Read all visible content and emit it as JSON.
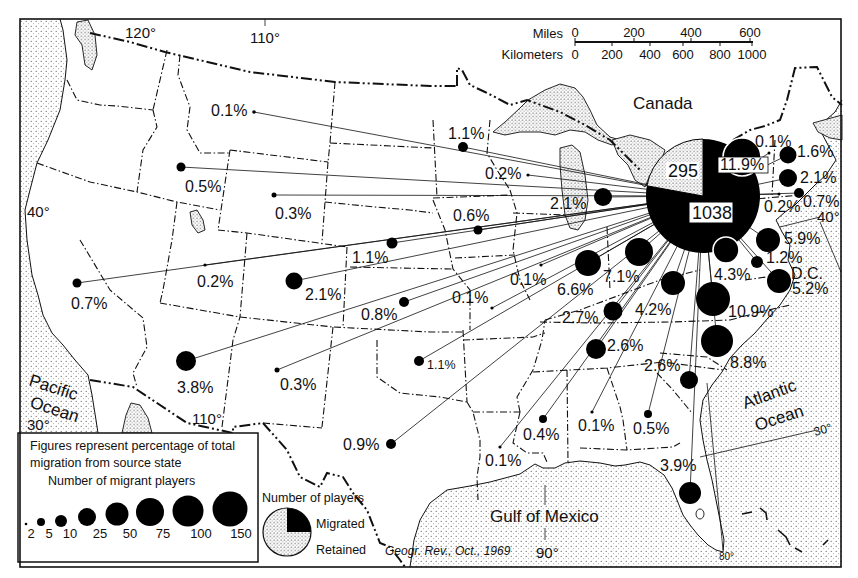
{
  "map": {
    "labels": {
      "canada": "Canada",
      "pacific_line1": "Pacific",
      "pacific_line2": "Ocean",
      "atlantic_line1": "Atlantic",
      "atlantic_line2": "Ocean",
      "gulf": "Gulf of Mexico",
      "dc": "D.C."
    },
    "graticule": {
      "lon_120": "120°",
      "lon_110_top": "110°",
      "lon_110_bottom": "110°",
      "lon_90": "90°",
      "lon_80": "80°",
      "lat_40_west": "40°",
      "lat_30_west": "30°",
      "lat_40_east": "40°",
      "lat_30_east": "30°"
    },
    "citation": "Geogr. Rev., Oct., 1969"
  },
  "scale_bar": {
    "miles_label": "Miles",
    "miles_ticks": [
      {
        "text": "0",
        "x": 575
      },
      {
        "text": "200",
        "x": 634
      },
      {
        "text": "400",
        "x": 691
      },
      {
        "text": "600",
        "x": 750
      }
    ],
    "km_label": "Kilometers",
    "km_ticks": [
      {
        "text": "0",
        "x": 575
      },
      {
        "text": "200",
        "x": 612
      },
      {
        "text": "400",
        "x": 650
      },
      {
        "text": "600",
        "x": 683
      },
      {
        "text": "800",
        "x": 720
      },
      {
        "text": "1000",
        "x": 752
      }
    ]
  },
  "pie": {
    "center": [
      703,
      196
    ],
    "radius": 57,
    "retained": 295,
    "migrated": 1038,
    "retained_label": "295",
    "migrated_label": "1038"
  },
  "flows": [
    {
      "pct": "0.1%",
      "dot": [
        254,
        112
      ],
      "r": 1.8,
      "label": [
        211,
        116
      ]
    },
    {
      "pct": "0.5%",
      "dot": [
        181,
        167
      ],
      "r": 4.5,
      "label": [
        185,
        192
      ]
    },
    {
      "pct": "0.3%",
      "dot": [
        274,
        195
      ],
      "r": 2.5,
      "label": [
        275,
        219
      ]
    },
    {
      "pct": "0.7%",
      "dot": [
        77,
        283
      ],
      "r": 4.5,
      "label": [
        71,
        309
      ]
    },
    {
      "pct": "0.2%",
      "dot": [
        205,
        265
      ],
      "r": 1.6,
      "label": [
        197,
        287
      ]
    },
    {
      "pct": "1.1%",
      "dot": [
        392,
        243
      ],
      "r": 5.5,
      "label": [
        352,
        263
      ]
    },
    {
      "pct": "2.1%",
      "dot": [
        294,
        281
      ],
      "r": 8.5,
      "label": [
        305,
        300
      ]
    },
    {
      "pct": "0.8%",
      "dot": [
        404,
        302
      ],
      "r": 5,
      "label": [
        361,
        320
      ]
    },
    {
      "pct": "0.1%",
      "dot": [
        492,
        308
      ],
      "r": 1.6,
      "label": [
        452,
        303
      ]
    },
    {
      "pct": "0.1%",
      "dot": [
        541,
        265
      ],
      "r": 1.6,
      "label": [
        510,
        285
      ]
    },
    {
      "pct": "0.6%",
      "dot": [
        478,
        230
      ],
      "r": 4.5,
      "label": [
        453,
        221
      ]
    },
    {
      "pct": "1.1%",
      "dot": [
        419,
        361
      ],
      "r": 5,
      "label": [
        427,
        369
      ],
      "small": true
    },
    {
      "pct": "0.3%",
      "dot": [
        277,
        370
      ],
      "r": 2.5,
      "label": [
        280,
        390
      ]
    },
    {
      "pct": "3.8%",
      "dot": [
        186,
        361
      ],
      "r": 10,
      "label": [
        177,
        393
      ]
    },
    {
      "pct": "0.9%",
      "dot": [
        391,
        444
      ],
      "r": 5,
      "label": [
        343,
        450
      ]
    },
    {
      "pct": "1.1%",
      "dot": [
        463,
        147
      ],
      "r": 5,
      "label": [
        448,
        139
      ]
    },
    {
      "pct": "0.2%",
      "dot": [
        528,
        175
      ],
      "r": 1.6,
      "label": [
        485,
        179
      ]
    },
    {
      "pct": "2.1%",
      "dot": [
        603,
        197
      ],
      "r": 9,
      "label": [
        550,
        209
      ]
    },
    {
      "pct": "0.1%",
      "dot": [
        769,
        153
      ],
      "r": 1.5,
      "label": [
        755,
        147
      ]
    },
    {
      "pct": "1.6%",
      "dot": [
        788,
        155
      ],
      "r": 8.5,
      "label": [
        797,
        157
      ]
    },
    {
      "pct": "2.1%",
      "dot": [
        788,
        178
      ],
      "r": 9,
      "label": [
        800,
        183
      ]
    },
    {
      "pct": "0.7%",
      "dot": [
        799,
        193
      ],
      "r": 5,
      "label": [
        803,
        207
      ]
    },
    {
      "pct": "0.2%",
      "dot": [
        779,
        194
      ],
      "r": 1.5,
      "label": [
        764,
        212
      ]
    },
    {
      "pct": "11.9%",
      "dot": [
        742,
        157
      ],
      "r": 19,
      "label": [
        720,
        170
      ],
      "outlined": true,
      "boxed": true
    },
    {
      "pct": "5.9%",
      "dot": [
        768,
        240
      ],
      "r": 12,
      "label": [
        784,
        244
      ]
    },
    {
      "pct": "4.3%",
      "dot": [
        726,
        250
      ],
      "r": 13,
      "label": [
        714,
        280
      ],
      "outlined": true
    },
    {
      "pct": "1.2%",
      "dot": [
        757,
        262
      ],
      "r": 6,
      "label": [
        766,
        263
      ]
    },
    {
      "pct": "5.2%",
      "dot": [
        779,
        281
      ],
      "r": 12,
      "label": [
        792,
        294
      ]
    },
    {
      "pct": "7.1%",
      "dot": [
        639,
        252
      ],
      "r": 14,
      "label": [
        603,
        282
      ]
    },
    {
      "pct": "6.6%",
      "dot": [
        588,
        263
      ],
      "r": 13,
      "label": [
        557,
        295
      ]
    },
    {
      "pct": "4.2%",
      "dot": [
        673,
        283
      ],
      "r": 12,
      "label": [
        635,
        315
      ]
    },
    {
      "pct": "2.7%",
      "dot": [
        613,
        311
      ],
      "r": 9.5,
      "label": [
        562,
        323
      ]
    },
    {
      "pct": "10.9%",
      "dot": [
        713,
        299
      ],
      "r": 17,
      "label": [
        728,
        317
      ]
    },
    {
      "pct": "8.8%",
      "dot": [
        717,
        341
      ],
      "r": 16,
      "label": [
        730,
        368
      ]
    },
    {
      "pct": "2.6%",
      "dot": [
        596,
        349
      ],
      "r": 10,
      "label": [
        607,
        351
      ]
    },
    {
      "pct": "2.6%",
      "dot": [
        689,
        380
      ],
      "r": 9,
      "label": [
        644,
        371
      ]
    },
    {
      "pct": "0.1%",
      "dot": [
        592,
        412
      ],
      "r": 1.6,
      "label": [
        578,
        431
      ]
    },
    {
      "pct": "0.5%",
      "dot": [
        648,
        414
      ],
      "r": 4,
      "label": [
        633,
        434
      ]
    },
    {
      "pct": "3.9%",
      "dot": [
        690,
        493
      ],
      "r": 11,
      "label": [
        660,
        471
      ]
    },
    {
      "pct": "0.4%",
      "dot": [
        543,
        419
      ],
      "r": 4,
      "label": [
        523,
        440
      ]
    },
    {
      "pct": "0.1%",
      "dot": [
        500,
        447
      ],
      "r": 1.6,
      "label": [
        485,
        466
      ]
    }
  ],
  "legend": {
    "note_line1": "Figures represent percentage of total",
    "note_line2": "migration from source state",
    "size_title": "Number of migrant players",
    "sizes": [
      {
        "value": "2",
        "r": 1.3,
        "cx": 26,
        "cy": 524,
        "label_x": 31
      },
      {
        "value": "5",
        "r": 4,
        "cx": 41,
        "cy": 522,
        "label_x": 49
      },
      {
        "value": "10",
        "r": 6,
        "cx": 61,
        "cy": 521,
        "label_x": 70
      },
      {
        "value": "25",
        "r": 9,
        "cx": 87,
        "cy": 517,
        "label_x": 100
      },
      {
        "value": "50",
        "r": 11.5,
        "cx": 117,
        "cy": 514,
        "label_x": 130
      },
      {
        "value": "75",
        "r": 14,
        "cx": 150,
        "cy": 512,
        "label_x": 163
      },
      {
        "value": "100",
        "r": 15.5,
        "cx": 188,
        "cy": 511,
        "label_x": 201
      },
      {
        "value": "150",
        "r": 17.5,
        "cx": 230,
        "cy": 509,
        "label_x": 241
      }
    ]
  },
  "pie_legend": {
    "title": "Number of players",
    "migrated": "Migrated",
    "retained": "Retained"
  }
}
